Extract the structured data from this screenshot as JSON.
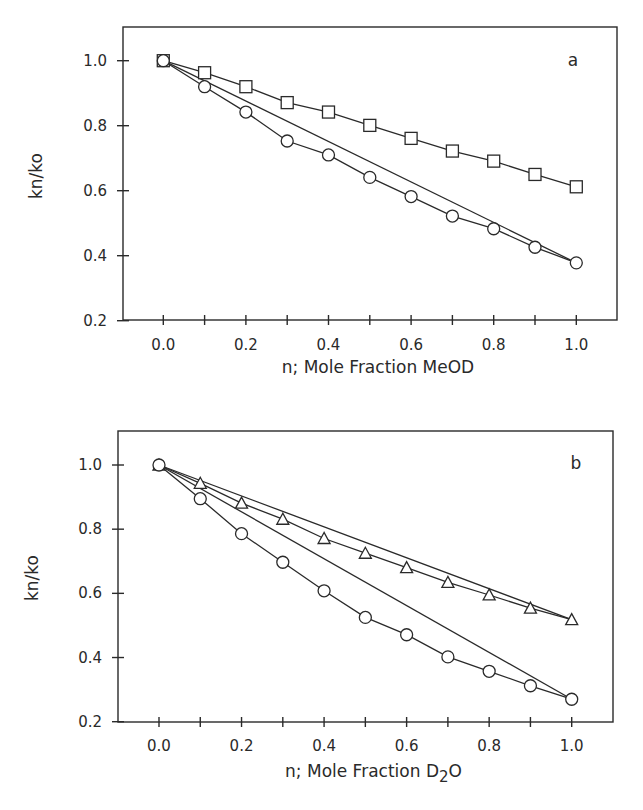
{
  "chart_data": [
    {
      "type": "line",
      "panel_label": "a",
      "title": "",
      "xlabel": "n; Mole Fraction MeOD",
      "ylabel": "kn/ko",
      "xlim": [
        -0.1,
        1.1
      ],
      "ylim": [
        0.2,
        1.1
      ],
      "xticks": [
        "0.0",
        "0.2",
        "0.4",
        "0.6",
        "0.8",
        "1.0"
      ],
      "yticks": [
        "0.2",
        "0.4",
        "0.6",
        "0.8",
        "1.0"
      ],
      "grid": false,
      "legend": "none",
      "x": [
        0.0,
        0.1,
        0.2,
        0.3,
        0.4,
        0.5,
        0.6,
        0.7,
        0.8,
        0.9,
        1.0
      ],
      "series": [
        {
          "name": "squares",
          "marker": "square",
          "values": [
            1.0,
            0.963,
            0.92,
            0.871,
            0.842,
            0.801,
            0.761,
            0.722,
            0.691,
            0.65,
            0.612
          ]
        },
        {
          "name": "circles",
          "marker": "circle",
          "values": [
            1.0,
            0.92,
            0.842,
            0.753,
            0.71,
            0.641,
            0.582,
            0.522,
            0.483,
            0.426,
            0.378
          ]
        }
      ],
      "reference_lines": [
        {
          "name": "linear reference (circles)",
          "from": [
            0.0,
            1.0
          ],
          "to": [
            1.0,
            0.378
          ]
        }
      ]
    },
    {
      "type": "line",
      "panel_label": "b",
      "title": "",
      "xlabel": "n; Mole Fraction D2O",
      "ylabel": "kn/ko",
      "xlim": [
        -0.1,
        1.1
      ],
      "ylim": [
        0.2,
        1.1
      ],
      "xticks": [
        "0.0",
        "0.2",
        "0.4",
        "0.6",
        "0.8",
        "1.0"
      ],
      "yticks": [
        "0.2",
        "0.4",
        "0.6",
        "0.8",
        "1.0"
      ],
      "grid": false,
      "legend": "none",
      "x": [
        0.0,
        0.1,
        0.2,
        0.3,
        0.4,
        0.5,
        0.6,
        0.7,
        0.8,
        0.9,
        1.0
      ],
      "series": [
        {
          "name": "triangles",
          "marker": "triangle",
          "values": [
            1.0,
            0.943,
            0.881,
            0.831,
            0.771,
            0.725,
            0.68,
            0.634,
            0.595,
            0.554,
            0.518
          ]
        },
        {
          "name": "circles",
          "marker": "circle",
          "values": [
            1.0,
            0.895,
            0.786,
            0.697,
            0.608,
            0.525,
            0.471,
            0.402,
            0.357,
            0.312,
            0.27
          ]
        }
      ],
      "reference_lines": [
        {
          "name": "linear reference (triangles)",
          "from": [
            0.0,
            1.0
          ],
          "to": [
            1.0,
            0.518
          ]
        },
        {
          "name": "linear reference (circles)",
          "from": [
            0.0,
            1.0
          ],
          "to": [
            1.0,
            0.27
          ]
        }
      ]
    }
  ],
  "panels": [
    {
      "label": "a",
      "ylabel": "kn/ko",
      "xlabel": "n; Mole Fraction MeOD"
    },
    {
      "label": "b",
      "ylabel": "kn/ko",
      "xlabel_main": "n; Mole Fraction D",
      "xlabel_sub": "2",
      "xlabel_tail": "O"
    }
  ]
}
